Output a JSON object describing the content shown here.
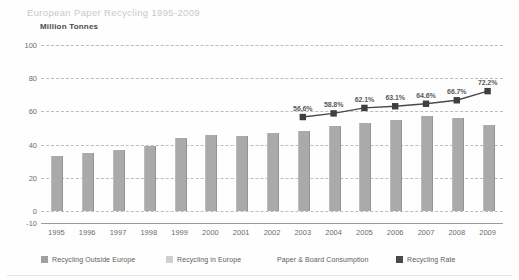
{
  "header": {
    "title": "European Paper Recycling 1995-2009",
    "unit_label": "Million Tonnes"
  },
  "legend": [
    {
      "label": "Recycling Outside Europe",
      "color": "#a0a0a0",
      "has_swatch": true
    },
    {
      "label": "Recycling in Europe",
      "color": "#cfcfcf",
      "has_swatch": true
    },
    {
      "label": "Paper & Board Consumption",
      "color": "#ffffff",
      "has_swatch": false
    },
    {
      "label": "Recycling Rate",
      "color": "#4a4a4a",
      "has_swatch": true
    }
  ],
  "colors": {
    "bar": "#aaaaaa",
    "line": "#4a4a4a",
    "marker": "#3f3f3f",
    "grid": "#bdbdbd",
    "title": "#c9c9c9",
    "axis_text": "#6d6d6d"
  },
  "chart_data": {
    "type": "bar",
    "title": "European Paper Recycling 1995-2009",
    "xlabel": "",
    "ylabel": "Million Tonnes",
    "ylim": [
      -10,
      100
    ],
    "yticks": [
      100,
      80,
      60,
      40,
      20,
      0,
      -10
    ],
    "grid": true,
    "legend_position": "bottom",
    "categories": [
      "1995",
      "1996",
      "1997",
      "1998",
      "1999",
      "2000",
      "2001",
      "2002",
      "2003",
      "2004",
      "2005",
      "2006",
      "2007",
      "2008",
      "2009"
    ],
    "series": [
      {
        "name": "Paper & Board Consumption",
        "type": "bar",
        "unit": "Million Tonnes",
        "values": [
          33,
          35,
          37,
          39,
          44,
          46,
          45,
          47,
          48,
          51,
          53,
          55,
          57,
          56,
          52
        ]
      },
      {
        "name": "Recycling Rate",
        "type": "line",
        "unit": "%",
        "axis": "secondary",
        "x": [
          "2003",
          "2004",
          "2005",
          "2006",
          "2007",
          "2008",
          "2009"
        ],
        "values": [
          56.6,
          58.8,
          62.1,
          63.1,
          64.6,
          66.7,
          72.2
        ],
        "labels": [
          "56.6%",
          "58.8%",
          "62.1%",
          "63.1%",
          "64.6%",
          "66.7%",
          "72.2%"
        ]
      }
    ]
  }
}
